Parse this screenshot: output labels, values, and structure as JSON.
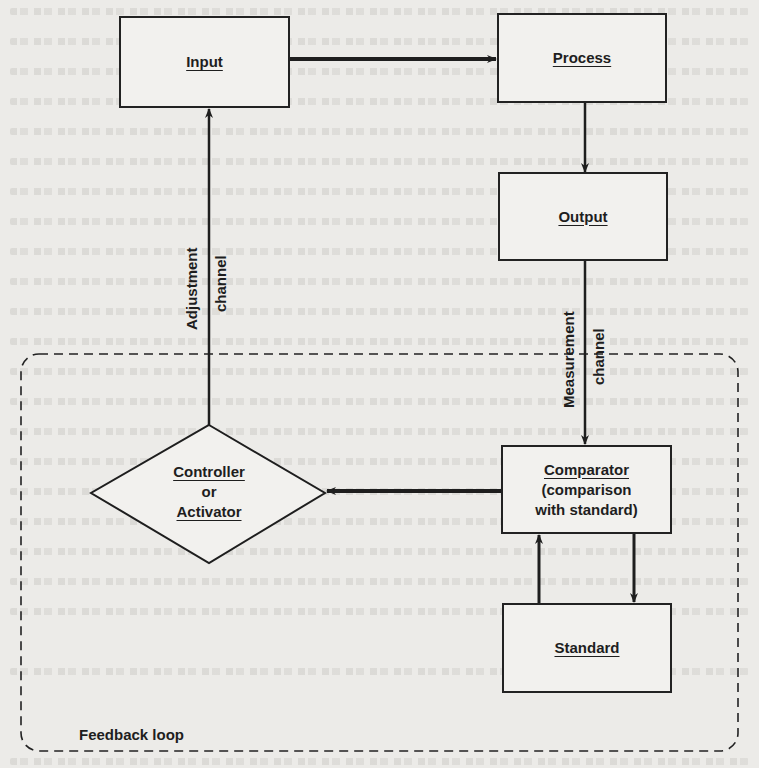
{
  "diagram": {
    "nodes": {
      "input": {
        "label": "Input"
      },
      "process": {
        "label": "Process"
      },
      "output": {
        "label": "Output"
      },
      "comparator": {
        "label": "Comparator",
        "sub1": "(comparison",
        "sub2": "with standard)"
      },
      "standard": {
        "label": "Standard"
      },
      "controller": {
        "label": "Controller",
        "or": "or",
        "label2": "Activator"
      }
    },
    "channels": {
      "adjustment": {
        "line1": "Adjustment",
        "line2": "channel"
      },
      "measurement": {
        "line1": "Measurement",
        "line2": "channel"
      }
    },
    "loop": {
      "label": "Feedback loop"
    },
    "edges": [
      {
        "from": "input",
        "to": "process"
      },
      {
        "from": "process",
        "to": "output"
      },
      {
        "from": "output",
        "to": "comparator",
        "via": "measurement channel"
      },
      {
        "from": "comparator",
        "to": "standard"
      },
      {
        "from": "standard",
        "to": "comparator"
      },
      {
        "from": "comparator",
        "to": "controller"
      },
      {
        "from": "controller",
        "to": "input",
        "via": "adjustment channel"
      }
    ],
    "colors": {
      "ink": "#1e1e1e",
      "paper": "#ecebe8"
    }
  }
}
